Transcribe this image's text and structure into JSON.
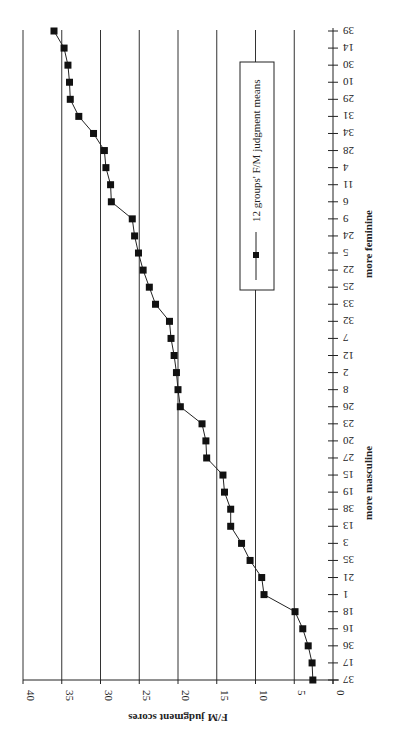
{
  "chart_data": {
    "type": "line",
    "orientation": "rotated-90-clockwise",
    "title": "",
    "xlabel": "",
    "ylabel": "F/M judgment scores",
    "ylim": [
      0,
      40
    ],
    "yticks": [
      0,
      5,
      10,
      15,
      20,
      25,
      30,
      35,
      40
    ],
    "grid": true,
    "categories": [
      "37",
      "17",
      "36",
      "16",
      "18",
      "1",
      "21",
      "35",
      "3",
      "13",
      "38",
      "19",
      "15",
      "27",
      "20",
      "23",
      "26",
      "8",
      "2",
      "12",
      "7",
      "32",
      "33",
      "25",
      "22",
      "5",
      "24",
      "9",
      "6",
      "11",
      "4",
      "28",
      "34",
      "31",
      "29",
      "10",
      "30",
      "14",
      "39"
    ],
    "series": [
      {
        "name": "12 groups' F/M judgment means",
        "marker": "square",
        "values": [
          2.6,
          2.7,
          3.2,
          3.9,
          4.9,
          8.9,
          9.2,
          10.7,
          11.8,
          13.2,
          13.2,
          14.0,
          14.2,
          16.3,
          16.4,
          16.9,
          19.7,
          20.0,
          20.2,
          20.5,
          20.9,
          21.1,
          22.9,
          23.7,
          24.5,
          25.1,
          25.6,
          25.9,
          28.6,
          28.7,
          29.3,
          29.5,
          30.9,
          32.8,
          33.9,
          34.0,
          34.2,
          34.7,
          36.0
        ]
      }
    ],
    "annotations": {
      "low_end": "more masculine",
      "high_end": "more feminine"
    },
    "legend_placement": "top-center",
    "colors": {
      "line": "#222222",
      "marker": "#111111",
      "grid": "#333333"
    }
  }
}
